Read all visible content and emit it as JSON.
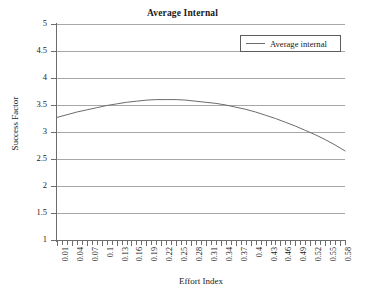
{
  "chart_data": {
    "type": "line",
    "title": "Average Internal",
    "xlabel": "Effort Index",
    "ylabel": "Success Factor",
    "xlim": [
      0.01,
      0.59
    ],
    "ylim": [
      1,
      5
    ],
    "ytick_values": [
      5,
      4.5,
      4,
      3.5,
      3,
      2.5,
      2,
      1.5,
      1
    ],
    "ytick_labels": [
      "5",
      "4.5",
      "4",
      "3.5",
      "3",
      "2.5",
      "2",
      "1.5",
      "1"
    ],
    "xtick_labels": [
      "0.01",
      "0.04",
      "0.07",
      "0.1",
      "0.13",
      "0.16",
      "0.19",
      "0.22",
      "0.25",
      "0.28",
      "0.31",
      "0.34",
      "0.37",
      "0.4",
      "0.43",
      "0.46",
      "0.49",
      "0.52",
      "0.55",
      "0.58"
    ],
    "xtick_step": 0.03,
    "minor_ticks_between": 2,
    "grid": "horizontal",
    "legend_position": "top-right",
    "line_color": "#6b6b6b",
    "grid_color": "#a7a7a7",
    "axis_color": "#6d6d6d",
    "series": [
      {
        "name": "Average internal",
        "x": [
          0.01,
          0.03,
          0.05,
          0.07,
          0.09,
          0.11,
          0.13,
          0.15,
          0.17,
          0.19,
          0.21,
          0.23,
          0.25,
          0.27,
          0.29,
          0.31,
          0.33,
          0.35,
          0.37,
          0.39,
          0.41,
          0.43,
          0.45,
          0.47,
          0.49,
          0.51,
          0.53,
          0.55,
          0.57,
          0.59
        ],
        "values": [
          3.27,
          3.32,
          3.37,
          3.41,
          3.45,
          3.49,
          3.52,
          3.55,
          3.57,
          3.59,
          3.6,
          3.6,
          3.6,
          3.59,
          3.57,
          3.55,
          3.53,
          3.5,
          3.46,
          3.42,
          3.37,
          3.31,
          3.25,
          3.18,
          3.11,
          3.03,
          2.95,
          2.86,
          2.76,
          2.65
        ]
      }
    ]
  }
}
